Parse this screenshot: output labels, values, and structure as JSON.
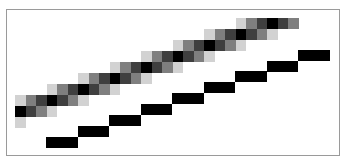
{
  "diagram": {
    "title": "",
    "frame": {
      "border_color": "#9a9a9a",
      "background": "#ffffff"
    },
    "palette": {
      "light": "#d2d2d2",
      "mid": "#7f7f7f",
      "dark": "#3f3f3f",
      "black": "#000000"
    },
    "antialiased_line": {
      "origin_x": 15,
      "cell_width": 10.5,
      "cell_height": 11,
      "rows": [
        {
          "top": 117,
          "cells": [
            {
              "col": 0,
              "tone": "light"
            }
          ]
        },
        {
          "top": 106,
          "cells": [
            {
              "col": 0,
              "tone": "black"
            },
            {
              "col": 1,
              "tone": "dark"
            },
            {
              "col": 2,
              "tone": "mid"
            },
            {
              "col": 3,
              "tone": "light"
            }
          ]
        },
        {
          "top": 95,
          "cells": [
            {
              "col": 0,
              "tone": "light"
            },
            {
              "col": 1,
              "tone": "mid"
            },
            {
              "col": 2,
              "tone": "dark"
            },
            {
              "col": 3,
              "tone": "black"
            },
            {
              "col": 4,
              "tone": "dark"
            },
            {
              "col": 5,
              "tone": "mid"
            },
            {
              "col": 6,
              "tone": "light"
            }
          ]
        },
        {
          "top": 84,
          "cells": [
            {
              "col": 3,
              "tone": "light"
            },
            {
              "col": 4,
              "tone": "mid"
            },
            {
              "col": 5,
              "tone": "dark"
            },
            {
              "col": 6,
              "tone": "black"
            },
            {
              "col": 7,
              "tone": "dark"
            },
            {
              "col": 8,
              "tone": "mid"
            },
            {
              "col": 9,
              "tone": "light"
            }
          ]
        },
        {
          "top": 73,
          "cells": [
            {
              "col": 6,
              "tone": "light"
            },
            {
              "col": 7,
              "tone": "mid"
            },
            {
              "col": 8,
              "tone": "dark"
            },
            {
              "col": 9,
              "tone": "black"
            },
            {
              "col": 10,
              "tone": "dark"
            },
            {
              "col": 11,
              "tone": "mid"
            },
            {
              "col": 12,
              "tone": "light"
            }
          ]
        },
        {
          "top": 62,
          "cells": [
            {
              "col": 9,
              "tone": "light"
            },
            {
              "col": 10,
              "tone": "mid"
            },
            {
              "col": 11,
              "tone": "dark"
            },
            {
              "col": 12,
              "tone": "black"
            },
            {
              "col": 13,
              "tone": "dark"
            },
            {
              "col": 14,
              "tone": "mid"
            },
            {
              "col": 15,
              "tone": "light"
            }
          ]
        },
        {
          "top": 51,
          "cells": [
            {
              "col": 12,
              "tone": "light"
            },
            {
              "col": 13,
              "tone": "mid"
            },
            {
              "col": 14,
              "tone": "dark"
            },
            {
              "col": 15,
              "tone": "black"
            },
            {
              "col": 16,
              "tone": "dark"
            },
            {
              "col": 17,
              "tone": "mid"
            },
            {
              "col": 18,
              "tone": "light"
            }
          ]
        },
        {
          "top": 40,
          "cells": [
            {
              "col": 15,
              "tone": "light"
            },
            {
              "col": 16,
              "tone": "mid"
            },
            {
              "col": 17,
              "tone": "dark"
            },
            {
              "col": 18,
              "tone": "black"
            },
            {
              "col": 19,
              "tone": "dark"
            },
            {
              "col": 20,
              "tone": "mid"
            },
            {
              "col": 21,
              "tone": "light"
            }
          ]
        },
        {
          "top": 29,
          "cells": [
            {
              "col": 18,
              "tone": "light"
            },
            {
              "col": 19,
              "tone": "mid"
            },
            {
              "col": 20,
              "tone": "dark"
            },
            {
              "col": 21,
              "tone": "black"
            },
            {
              "col": 22,
              "tone": "dark"
            },
            {
              "col": 23,
              "tone": "mid"
            },
            {
              "col": 24,
              "tone": "light"
            }
          ]
        },
        {
          "top": 18,
          "cells": [
            {
              "col": 21,
              "tone": "light"
            },
            {
              "col": 22,
              "tone": "mid"
            },
            {
              "col": 23,
              "tone": "dark"
            },
            {
              "col": 24,
              "tone": "black"
            },
            {
              "col": 25,
              "tone": "dark"
            },
            {
              "col": 26,
              "tone": "mid"
            }
          ]
        }
      ]
    },
    "aliased_line": {
      "color": "#000000",
      "block_width": 31.5,
      "block_height": 11,
      "blocks": [
        {
          "x": 46,
          "y": 137
        },
        {
          "x": 77.5,
          "y": 126
        },
        {
          "x": 109,
          "y": 115
        },
        {
          "x": 140.5,
          "y": 104
        },
        {
          "x": 172,
          "y": 93
        },
        {
          "x": 203.5,
          "y": 82
        },
        {
          "x": 235,
          "y": 71
        },
        {
          "x": 266.5,
          "y": 61
        },
        {
          "x": 298,
          "y": 50
        }
      ]
    }
  }
}
